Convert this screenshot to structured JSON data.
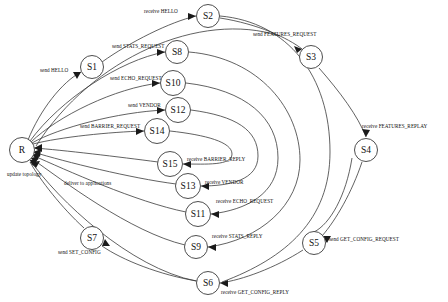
{
  "diagram": {
    "type": "state-transition-graph",
    "background_color": "#ffffff",
    "stroke_color": "#3a3a3a",
    "text_color": "#101010",
    "nodes": [
      {
        "id": "R",
        "label": "R",
        "x": 22,
        "y": 150,
        "r": 12.5
      },
      {
        "id": "S1",
        "label": "S1",
        "x": 92,
        "y": 67,
        "r": 11.5
      },
      {
        "id": "S2",
        "label": "S2",
        "x": 208,
        "y": 16,
        "r": 11.5
      },
      {
        "id": "S3",
        "label": "S3",
        "x": 311,
        "y": 57,
        "r": 11.5
      },
      {
        "id": "S4",
        "label": "S4",
        "x": 366,
        "y": 150,
        "r": 11.5
      },
      {
        "id": "S5",
        "label": "S5",
        "x": 314,
        "y": 243,
        "r": 11.5
      },
      {
        "id": "S6",
        "label": "S6",
        "x": 208,
        "y": 283,
        "r": 11.5
      },
      {
        "id": "S7",
        "label": "S7",
        "x": 92,
        "y": 238,
        "r": 11.5
      },
      {
        "id": "S8",
        "label": "S8",
        "x": 177,
        "y": 52,
        "r": 11.5
      },
      {
        "id": "S9",
        "label": "S9",
        "x": 196,
        "y": 247,
        "r": 11.5
      },
      {
        "id": "S10",
        "label": "S10",
        "x": 173,
        "y": 83,
        "r": 12.5
      },
      {
        "id": "S11",
        "label": "S11",
        "x": 198,
        "y": 214,
        "r": 12.5
      },
      {
        "id": "S12",
        "label": "S12",
        "x": 178,
        "y": 110,
        "r": 12.5
      },
      {
        "id": "S13",
        "label": "S13",
        "x": 188,
        "y": 186,
        "r": 12.5
      },
      {
        "id": "S14",
        "label": "S14",
        "x": 157,
        "y": 131,
        "r": 12.5
      },
      {
        "id": "S15",
        "label": "S15",
        "x": 170,
        "y": 164,
        "r": 12.5
      }
    ],
    "edges": [
      {
        "from": "R",
        "to": "S1",
        "label": "send HELLO"
      },
      {
        "from": "S1",
        "to": "S2",
        "label": "receive HELLO"
      },
      {
        "from": "S2",
        "to": "S3",
        "label": "send FEATURES_REQUEST"
      },
      {
        "from": "S3",
        "to": "S4",
        "label": "receive FEATURES_REPLAY"
      },
      {
        "from": "S4",
        "to": "S5",
        "label": "send GET_CONFIG_REQUEST"
      },
      {
        "from": "S5",
        "to": "S6",
        "label": "receive GET_CONFIG_REPLY"
      },
      {
        "from": "S6",
        "to": "S7",
        "label": "send SET_CONFIG"
      },
      {
        "from": "R",
        "to": "S8",
        "label": "send STATS_REQUEST"
      },
      {
        "from": "S8",
        "to": "S9",
        "label": "receive STATS_REPLY"
      },
      {
        "from": "R",
        "to": "S10",
        "label": "send ECHO_REQUEST"
      },
      {
        "from": "S10",
        "to": "S11",
        "label": "receive ECHO_REQUEST"
      },
      {
        "from": "R",
        "to": "S12",
        "label": "send VENDOR"
      },
      {
        "from": "S12",
        "to": "S13",
        "label": "receive VENDOR"
      },
      {
        "from": "R",
        "to": "S14",
        "label": "send BARRIER_REQUEST"
      },
      {
        "from": "S14",
        "to": "S15",
        "label": "receive BARRIER_REPLY"
      },
      {
        "from": "S7",
        "to": "R",
        "label": "update topology"
      },
      {
        "from": "S13",
        "to": "R",
        "label": "deliver to applications"
      }
    ],
    "edge_labels": {
      "send_hello": "send HELLO",
      "receive_hello": "receive HELLO",
      "send_features_request": "send FEATURES_REQUEST",
      "receive_features_replay": "receive FEATURES_REPLAY",
      "send_get_config_request": "send GET_CONFIG_REQUEST",
      "receive_get_config_reply": "receive GET_CONFIG_REPLY",
      "send_set_config": "send SET_CONFIG",
      "send_stats_request": "send STATS_REQUEST",
      "receive_stats_reply": "receive STATS_REPLY",
      "send_echo_request": "send ECHO_REQUEST",
      "receive_echo_request": "receive ECHO_REQUEST",
      "send_vendor": "send VENDOR",
      "receive_vendor": "receive VENDOR",
      "send_barrier_request": "send BARRIER_REQUEST",
      "receive_barrier_reply": "receive BARRIER_REPLY",
      "update_topology": "update topology",
      "deliver_to_applications": "deliver to applications"
    },
    "node_labels": {
      "R": "R",
      "S1": "S1",
      "S2": "S2",
      "S3": "S3",
      "S4": "S4",
      "S5": "S5",
      "S6": "S6",
      "S7": "S7",
      "S8": "S8",
      "S9": "S9",
      "S10": "S10",
      "S11": "S11",
      "S12": "S12",
      "S13": "S13",
      "S14": "S14",
      "S15": "S15"
    }
  }
}
